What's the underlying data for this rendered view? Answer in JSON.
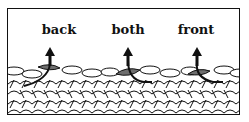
{
  "diagram": {
    "labels": [
      {
        "text": "back",
        "x": 52
      },
      {
        "text": "both",
        "x": 128
      },
      {
        "text": "front",
        "x": 197
      }
    ],
    "colors": {
      "highlight_loop": "#6e6e6e",
      "stroke": "#111111",
      "background": "#ffffff"
    }
  }
}
